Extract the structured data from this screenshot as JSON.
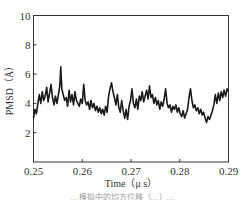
{
  "chart_data": {
    "type": "line",
    "title": "",
    "xlabel": "Time（μ s）",
    "ylabel": "PMSD（Å）",
    "xlim": [
      0.25,
      0.29
    ],
    "ylim": [
      0,
      10
    ],
    "xticks": [
      0.25,
      0.26,
      0.27,
      0.28,
      0.29
    ],
    "xtick_labels": [
      "0.25",
      "0.26",
      "0.27",
      "0.28",
      "0.29"
    ],
    "yticks": [
      2,
      4,
      6,
      8,
      10
    ],
    "ytick_labels": [
      "2",
      "4",
      "6",
      "8",
      "10"
    ],
    "grid": false,
    "legend": null,
    "series": [
      {
        "name": "PMSD",
        "color": "#1a1a1a",
        "x": [
          0.25,
          0.2503,
          0.2506,
          0.2509,
          0.2512,
          0.2515,
          0.2518,
          0.2521,
          0.2524,
          0.2527,
          0.253,
          0.2533,
          0.2536,
          0.2539,
          0.2542,
          0.2545,
          0.2548,
          0.2551,
          0.2554,
          0.2556,
          0.2558,
          0.2561,
          0.2564,
          0.2567,
          0.257,
          0.2573,
          0.2576,
          0.2579,
          0.2582,
          0.2585,
          0.2588,
          0.2591,
          0.2594,
          0.2597,
          0.26,
          0.2603,
          0.2606,
          0.2609,
          0.2612,
          0.2615,
          0.2618,
          0.2621,
          0.2624,
          0.2627,
          0.263,
          0.2633,
          0.2636,
          0.2639,
          0.2642,
          0.2645,
          0.2648,
          0.2651,
          0.2654,
          0.2657,
          0.266,
          0.2663,
          0.2666,
          0.2669,
          0.2672,
          0.2675,
          0.2678,
          0.2681,
          0.2684,
          0.2687,
          0.269,
          0.2693,
          0.2696,
          0.2699,
          0.2702,
          0.2705,
          0.2708,
          0.2711,
          0.2714,
          0.2717,
          0.272,
          0.2723,
          0.2726,
          0.2729,
          0.2732,
          0.2735,
          0.2738,
          0.2741,
          0.2744,
          0.2747,
          0.275,
          0.2753,
          0.2756,
          0.2759,
          0.2762,
          0.2765,
          0.2768,
          0.2771,
          0.2774,
          0.2777,
          0.278,
          0.2783,
          0.2786,
          0.2789,
          0.2792,
          0.2795,
          0.2798,
          0.2801,
          0.2804,
          0.2807,
          0.281,
          0.2813,
          0.2816,
          0.2819,
          0.2822,
          0.2825,
          0.2828,
          0.2831,
          0.2834,
          0.2837,
          0.284,
          0.2843,
          0.2846,
          0.2849,
          0.2852,
          0.2855,
          0.2858,
          0.2861,
          0.2864,
          0.2867,
          0.287,
          0.2873,
          0.2876,
          0.2879,
          0.2882,
          0.2885,
          0.2888,
          0.2891,
          0.2894,
          0.2897,
          0.29
        ],
        "y": [
          3.0,
          3.6,
          3.3,
          4.0,
          4.6,
          4.0,
          4.8,
          4.2,
          4.5,
          5.1,
          4.1,
          4.7,
          5.3,
          4.4,
          3.9,
          4.5,
          4.0,
          4.6,
          5.2,
          6.5,
          5.0,
          4.6,
          4.2,
          4.4,
          3.8,
          4.9,
          4.1,
          4.6,
          3.9,
          4.8,
          4.2,
          4.0,
          3.8,
          4.3,
          4.0,
          5.3,
          4.2,
          3.9,
          4.1,
          3.6,
          4.2,
          3.7,
          4.0,
          3.5,
          3.8,
          3.4,
          3.7,
          3.3,
          3.6,
          3.2,
          3.8,
          3.4,
          4.5,
          5.0,
          5.4,
          4.8,
          4.4,
          3.9,
          4.6,
          3.7,
          3.4,
          4.2,
          3.5,
          3.0,
          3.6,
          2.9,
          3.8,
          4.2,
          5.0,
          4.0,
          3.7,
          4.3,
          3.6,
          4.5,
          4.2,
          4.8,
          4.1,
          4.5,
          4.9,
          4.3,
          5.2,
          4.4,
          4.6,
          4.0,
          4.4,
          3.9,
          4.2,
          3.6,
          4.1,
          3.8,
          4.3,
          5.0,
          4.0,
          3.7,
          3.9,
          3.4,
          3.8,
          3.6,
          3.9,
          3.4,
          3.7,
          3.3,
          3.1,
          3.5,
          3.0,
          3.3,
          3.6,
          4.4,
          5.0,
          4.2,
          3.7,
          3.9,
          3.5,
          3.7,
          3.3,
          3.6,
          3.2,
          3.4,
          3.0,
          2.7,
          3.1,
          2.9,
          3.2,
          3.5,
          3.9,
          4.6,
          4.0,
          4.7,
          4.2,
          4.8,
          4.4,
          4.9,
          4.5,
          5.0,
          4.8
        ]
      }
    ]
  },
  "caption": "…模拟中的均方位移（…）…"
}
